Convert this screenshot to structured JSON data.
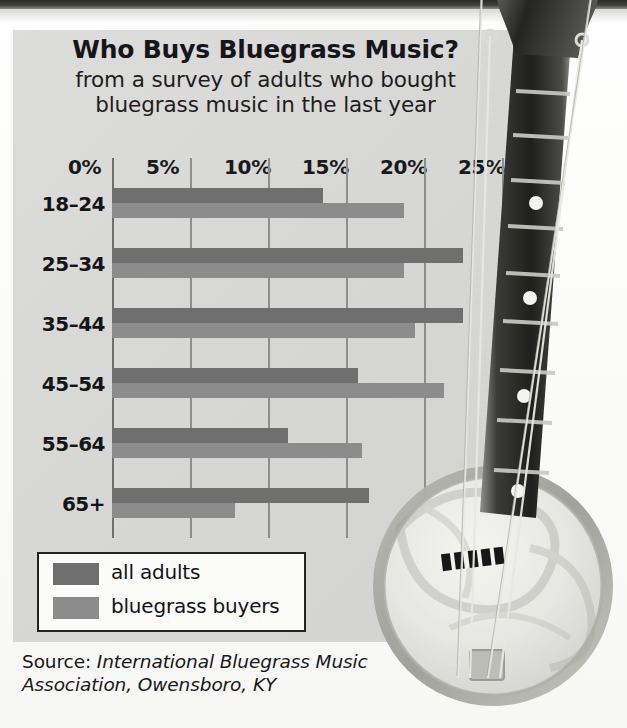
{
  "chart_data": {
    "type": "bar",
    "orientation": "horizontal",
    "title": "Who Buys Bluegrass Music?",
    "subtitle_line1": "from a survey of adults who bought",
    "subtitle_line2": "bluegrass music in the last year",
    "xlabel": "",
    "ylabel": "",
    "xlim": [
      0,
      27
    ],
    "grid": true,
    "legend_position": "bottom-left",
    "tick_labels": [
      "0%",
      "5%",
      "10%",
      "15%",
      "20%",
      "25%"
    ],
    "tick_values": [
      0,
      5,
      10,
      15,
      20,
      25
    ],
    "categories": [
      "18–24",
      "25–34",
      "35–44",
      "45–54",
      "55–64",
      "65+"
    ],
    "series": [
      {
        "name": "all adults",
        "color": "#6f6f6f",
        "values": [
          13.5,
          22.5,
          22.5,
          15.8,
          11.3,
          16.5
        ]
      },
      {
        "name": "bluegrass buyers",
        "color": "#8c8c8c",
        "values": [
          18.7,
          18.7,
          19.4,
          21.3,
          16.0,
          7.9
        ]
      }
    ],
    "source_prefix": "Source: ",
    "source_text": "International Bluegrass Music Association, Owensboro, KY"
  },
  "legend": {
    "items": [
      {
        "label": "all adults"
      },
      {
        "label": "bluegrass buyers"
      }
    ]
  },
  "colors": {
    "panel_bg": "#d9d9d7",
    "all_adults": "#6f6f6f",
    "bluegrass_buyers": "#8c8c8c",
    "gridline": "#8e8e8c",
    "text": "#141417"
  },
  "decoration": {
    "photo": "banjo-photograph"
  }
}
